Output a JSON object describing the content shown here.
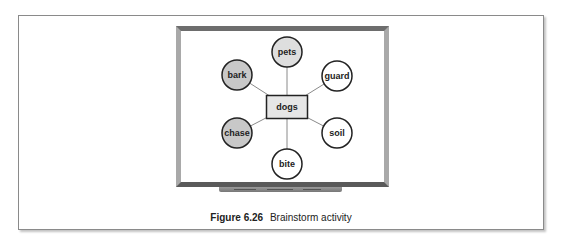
{
  "figure": {
    "caption_number": "Figure 6.26",
    "caption_text": "Brainstorm activity"
  },
  "diagram": {
    "center": {
      "label": "dogs",
      "x": 287,
      "y": 107,
      "w": 41,
      "h": 23,
      "fill": "#e6e6e6"
    },
    "nodes": [
      {
        "label": "pets",
        "x": 287,
        "y": 52,
        "fill": "#dedede"
      },
      {
        "label": "bark",
        "x": 237,
        "y": 75,
        "fill": "#c8c8c8"
      },
      {
        "label": "guard",
        "x": 337,
        "y": 76,
        "fill": "#ffffff"
      },
      {
        "label": "chase",
        "x": 237,
        "y": 133,
        "fill": "#c8c8c8"
      },
      {
        "label": "soil",
        "x": 337,
        "y": 133,
        "fill": "#ffffff"
      },
      {
        "label": "bite",
        "x": 287,
        "y": 164,
        "fill": "#ffffff"
      }
    ],
    "node_radius": 15,
    "stroke_color": "#222222",
    "connector_color": "#8a8a8a"
  }
}
